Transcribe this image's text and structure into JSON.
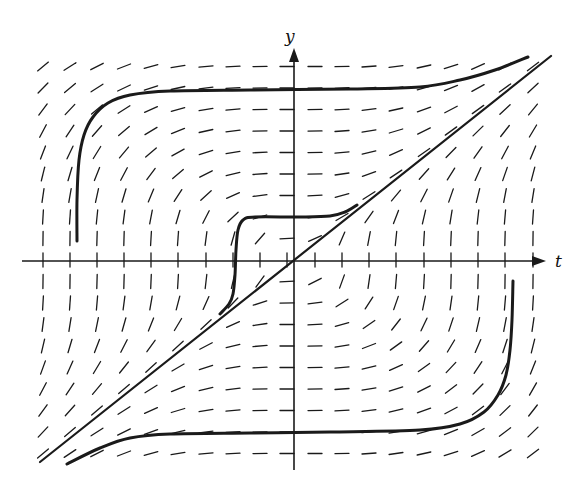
{
  "figure": {
    "type": "slope_field",
    "colors": {
      "ink": "#1a1a1a",
      "background": "#ffffff"
    }
  },
  "axes": {
    "x_label": "t",
    "y_label": "y",
    "origin_px": [
      294,
      261
    ],
    "x_axis_px": {
      "from": 22,
      "to": 546
    },
    "y_axis_px": {
      "from": 470,
      "to": 48
    },
    "x_label_px": [
      555,
      267
    ],
    "y_label_px": [
      291,
      42
    ]
  },
  "chart_data": {
    "type": "slope_field",
    "title": "",
    "xlabel": "t",
    "ylabel": "y",
    "equation_inferred": "dy/dt = t^2 / y^2",
    "grid": {
      "columns_px": [
        43,
        70,
        97,
        124,
        151,
        178,
        206,
        233,
        260,
        287,
        315,
        342,
        369,
        396,
        424,
        451,
        478,
        505,
        533
      ],
      "rows_px": [
        66.5,
        88,
        109.5,
        131,
        152.5,
        174,
        195.5,
        217,
        238.5,
        260,
        281.5,
        303,
        324.5,
        346,
        367.5,
        389,
        410.5,
        432,
        453.5
      ],
      "t_unit_px": 27.2,
      "y_unit_px": 21.5,
      "segment_length_px": 14
    },
    "solution_curves": [
      {
        "name": "upper-left curve",
        "points_px": [
          [
            77,
            241
          ],
          [
            77,
            200
          ],
          [
            79,
            160
          ],
          [
            84,
            135
          ],
          [
            93,
            117
          ],
          [
            108,
            103
          ],
          [
            130,
            95
          ],
          [
            170,
            91
          ],
          [
            250,
            90
          ],
          [
            350,
            89
          ],
          [
            420,
            87
          ],
          [
            460,
            80
          ],
          [
            495,
            70
          ],
          [
            528,
            57
          ]
        ]
      },
      {
        "name": "diagonal y = t",
        "points_px": [
          [
            40,
            462
          ],
          [
            551,
            56
          ]
        ]
      },
      {
        "name": "middle curve",
        "points_px": [
          [
            220,
            314
          ],
          [
            229,
            304
          ],
          [
            233,
            294
          ],
          [
            235,
            275
          ],
          [
            236,
            250
          ],
          [
            238,
            230
          ],
          [
            243,
            220
          ],
          [
            255,
            217
          ],
          [
            300,
            217
          ],
          [
            330,
            216
          ],
          [
            345,
            212
          ],
          [
            357,
            205
          ]
        ]
      },
      {
        "name": "lower-right curve",
        "points_px": [
          [
            513,
            281
          ],
          [
            512,
            320
          ],
          [
            510,
            350
          ],
          [
            506,
            375
          ],
          [
            498,
            395
          ],
          [
            484,
            412
          ],
          [
            460,
            424
          ],
          [
            420,
            430
          ],
          [
            330,
            432
          ],
          [
            250,
            433
          ],
          [
            170,
            434
          ],
          [
            130,
            438
          ],
          [
            100,
            448
          ],
          [
            67,
            464
          ]
        ]
      }
    ]
  }
}
